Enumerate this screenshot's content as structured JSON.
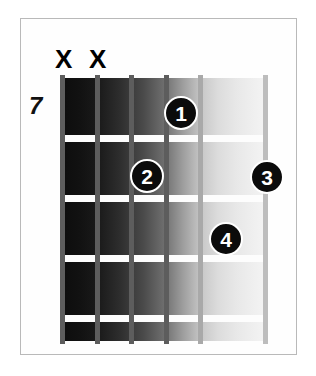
{
  "diagram": {
    "type": "guitar-chord-diagram",
    "position_label": "7",
    "strings_count": 6,
    "frets_count": 4,
    "muted_strings": [
      {
        "label": "X",
        "string": 6,
        "x": 55,
        "y": 46
      },
      {
        "label": "X",
        "string": 5,
        "x": 89,
        "y": 46
      }
    ],
    "finger_dots": [
      {
        "label": "1",
        "string": 4,
        "fret": 1,
        "cx": 181,
        "cy": 113
      },
      {
        "label": "2",
        "string": 3,
        "fret": 2,
        "cx": 147,
        "cy": 176
      },
      {
        "label": "3",
        "string": 1,
        "fret": 2,
        "cx": 267,
        "cy": 177
      },
      {
        "label": "4",
        "string": 2,
        "fret": 3,
        "cx": 226,
        "cy": 239
      }
    ],
    "fret_lines_y": [
      57,
      117,
      177,
      237
    ],
    "string_lines_x": [
      0,
      35,
      69,
      104,
      138,
      172,
      203
    ],
    "colors": {
      "dot_fill": "#0b0b0b",
      "dot_text": "#ffffff",
      "fret_wire": "#fdfdfd",
      "frame_border": "#b9b9b9",
      "background": "#ffffff",
      "board_dark": "#0c0c0c",
      "board_light": "#f4f4f4"
    }
  }
}
